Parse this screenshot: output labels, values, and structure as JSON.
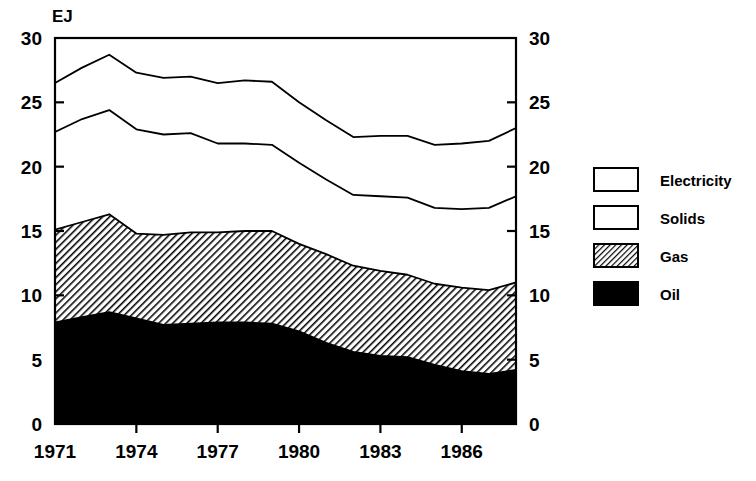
{
  "chart_data": {
    "type": "area",
    "title": "",
    "subtitle": "",
    "xlabel": "",
    "ylabel": "EJ",
    "unit_label": "EJ",
    "stacked": true,
    "grid": false,
    "legend_position": "right",
    "x": [
      1971,
      1972,
      1973,
      1974,
      1975,
      1976,
      1977,
      1978,
      1979,
      1980,
      1981,
      1982,
      1983,
      1984,
      1985,
      1986,
      1987,
      1988
    ],
    "xlim": [
      1971,
      1988
    ],
    "ylim": [
      0,
      30
    ],
    "xticks": [
      1971,
      1974,
      1977,
      1980,
      1983,
      1986
    ],
    "xticklabels": [
      "1971",
      "1974",
      "1977",
      "1980",
      "1983",
      "1986"
    ],
    "yticks": [
      0,
      5,
      10,
      15,
      20,
      25,
      30
    ],
    "yticklabels": [
      "0",
      "5",
      "10",
      "15",
      "20",
      "25",
      "30"
    ],
    "yticklabels_right": [
      "0",
      "5",
      "10",
      "15",
      "20",
      "25",
      "30"
    ],
    "series": [
      {
        "name": "Oil",
        "fill": "solid-black",
        "color": "#000000",
        "values": [
          7.9,
          8.3,
          8.7,
          8.2,
          7.7,
          7.8,
          7.9,
          7.9,
          7.8,
          7.2,
          6.3,
          5.6,
          5.3,
          5.2,
          4.6,
          4.1,
          3.9,
          4.2
        ]
      },
      {
        "name": "Gas",
        "fill": "diagonal-hatch",
        "color": "#3a3a3a",
        "values": [
          7.2,
          7.4,
          7.6,
          6.6,
          7.0,
          7.1,
          7.0,
          7.1,
          7.2,
          6.8,
          6.9,
          6.7,
          6.6,
          6.4,
          6.3,
          6.5,
          6.5,
          6.8
        ]
      },
      {
        "name": "Solids",
        "fill": "white",
        "color": "#ffffff",
        "values": [
          7.6,
          8.0,
          8.1,
          8.1,
          7.8,
          7.7,
          6.9,
          6.8,
          6.7,
          6.3,
          5.8,
          5.5,
          5.8,
          6.0,
          5.9,
          6.1,
          6.4,
          6.7
        ]
      },
      {
        "name": "Electricity",
        "fill": "white",
        "color": "#ffffff",
        "values": [
          3.8,
          4.0,
          4.3,
          4.4,
          4.4,
          4.4,
          4.7,
          4.9,
          4.9,
          4.7,
          4.6,
          4.5,
          4.7,
          4.8,
          4.9,
          5.1,
          5.2,
          5.3
        ]
      }
    ],
    "cumulative_boundaries": {
      "oil_top": [
        7.9,
        8.3,
        8.7,
        8.2,
        7.7,
        7.8,
        7.9,
        7.9,
        7.8,
        7.2,
        6.3,
        5.6,
        5.3,
        5.2,
        4.6,
        4.1,
        3.9,
        4.2
      ],
      "gas_top": [
        15.1,
        15.7,
        16.3,
        14.8,
        14.7,
        14.9,
        14.9,
        15.0,
        15.0,
        14.0,
        13.2,
        12.3,
        11.9,
        11.6,
        10.9,
        10.6,
        10.4,
        11.0
      ],
      "solids_top": [
        22.7,
        23.7,
        24.4,
        22.9,
        22.5,
        22.6,
        21.8,
        21.8,
        21.7,
        20.3,
        19.0,
        17.8,
        17.7,
        17.6,
        16.8,
        16.7,
        16.8,
        17.7
      ],
      "electricity_top": [
        26.5,
        27.7,
        28.7,
        27.3,
        26.9,
        27.0,
        26.5,
        26.7,
        26.6,
        25.0,
        23.6,
        22.3,
        22.4,
        22.4,
        21.7,
        21.8,
        22.0,
        23.0
      ]
    },
    "totals": [
      26.5,
      27.7,
      28.7,
      27.3,
      26.9,
      27.0,
      26.5,
      26.7,
      26.6,
      25.0,
      23.6,
      22.3,
      22.4,
      22.4,
      21.7,
      21.8,
      22.0,
      23.0
    ]
  },
  "legend": {
    "items": [
      {
        "label": "Electricity",
        "fill": "white"
      },
      {
        "label": "Solids",
        "fill": "white"
      },
      {
        "label": "Gas",
        "fill": "diagonal-hatch"
      },
      {
        "label": "Oil",
        "fill": "solid-black"
      }
    ]
  },
  "axes": {
    "unit": "EJ",
    "left_ticks": [
      "30",
      "25",
      "20",
      "15",
      "10",
      "5",
      "0"
    ],
    "right_ticks": [
      "30",
      "25",
      "20",
      "15",
      "10",
      "5",
      "0"
    ],
    "x_ticks": [
      "1971",
      "1974",
      "1977",
      "1980",
      "1983",
      "1986"
    ]
  },
  "colors": {
    "ink": "#000000",
    "background": "#ffffff",
    "hatch": "#2e2e2e"
  }
}
